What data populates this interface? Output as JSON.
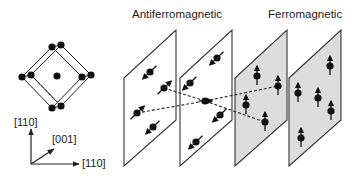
{
  "titles": {
    "antiferromagnetic": "Antiferromagnetic",
    "ferromagnetic": "Ferromagnetic"
  },
  "axes": {
    "vertical_label": "[110]",
    "depth_label": "[001]",
    "horizontal_label": "[110]"
  },
  "colors": {
    "line": "#2a2a2a",
    "atom": "#111111",
    "ferro_plane_fill": "#dcdcdc",
    "afm_plane_fill": "#ffffff"
  },
  "planes": [
    {
      "group": "antiferromagnetic",
      "fill": "white",
      "atoms": [
        {
          "x": 150,
          "y": 72,
          "spin": "down-left"
        },
        {
          "x": 164,
          "y": 88,
          "spin": "up-right"
        },
        {
          "x": 137,
          "y": 113,
          "spin": "up-right"
        },
        {
          "x": 153,
          "y": 127,
          "spin": "down-left"
        }
      ]
    },
    {
      "group": "antiferromagnetic",
      "fill": "white",
      "atoms": [
        {
          "x": 217,
          "y": 58,
          "spin": "down-left"
        },
        {
          "x": 190,
          "y": 83,
          "spin": "down-left"
        },
        {
          "x": 205,
          "y": 101,
          "spin": "right"
        },
        {
          "x": 220,
          "y": 115,
          "spin": "down-left"
        },
        {
          "x": 196,
          "y": 142,
          "spin": "down-left"
        }
      ]
    },
    {
      "group": "ferromagnetic",
      "fill": "gray",
      "atoms": [
        {
          "x": 257,
          "y": 76,
          "spin": "up"
        },
        {
          "x": 278,
          "y": 86,
          "spin": "up"
        },
        {
          "x": 246,
          "y": 105,
          "spin": "up"
        },
        {
          "x": 265,
          "y": 122,
          "spin": "up"
        }
      ]
    },
    {
      "group": "ferromagnetic",
      "fill": "gray",
      "atoms": [
        {
          "x": 330,
          "y": 66,
          "spin": "up"
        },
        {
          "x": 298,
          "y": 93,
          "spin": "up"
        },
        {
          "x": 318,
          "y": 98,
          "spin": "up"
        },
        {
          "x": 331,
          "y": 111,
          "spin": "up"
        },
        {
          "x": 301,
          "y": 138,
          "spin": "up"
        }
      ]
    }
  ]
}
